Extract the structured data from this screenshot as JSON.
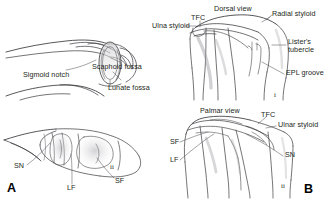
{
  "figure": {
    "background_color": "#ffffff",
    "ink_color": "#231f20",
    "width": 331,
    "height": 206
  },
  "panels": [
    {
      "letter": "A",
      "description": "distal radius articular surface, lateral and end-on views"
    },
    {
      "letter": "B",
      "description": "distal radius dorsal and palmar views"
    }
  ],
  "panel_a": {
    "letter": "A",
    "labels": [
      {
        "text": "Sigmoid notch",
        "x": 23,
        "y": 71
      },
      {
        "text": "Scaphoid fossa",
        "x": 92,
        "y": 63
      },
      {
        "text": "Lunate fossa",
        "x": 108,
        "y": 84
      }
    ],
    "abbreviations": [
      {
        "text": "SN",
        "x": 14,
        "y": 166
      },
      {
        "text": "LF",
        "x": 67,
        "y": 187
      },
      {
        "text": "SF",
        "x": 115,
        "y": 180
      }
    ],
    "markers": [
      {
        "text": "ii",
        "x": 110,
        "y": 167
      }
    ]
  },
  "panel_b": {
    "letter": "B",
    "dorsal_view_title": "Dorsal view",
    "palmar_view_title": "Palmar view",
    "labels": [
      {
        "text": "Dorsal view",
        "x": 214,
        "y": 7
      },
      {
        "text": "TFC",
        "x": 191,
        "y": 16
      },
      {
        "text": "Ulna styloid",
        "x": 152,
        "y": 24
      },
      {
        "text": "Radial styloid",
        "x": 272,
        "y": 12
      },
      {
        "text": "Lister's",
        "x": 288,
        "y": 40
      },
      {
        "text": "tubercle",
        "x": 288,
        "y": 48
      },
      {
        "text": "EPL groove",
        "x": 286,
        "y": 71
      },
      {
        "text": "Palmar view",
        "x": 200,
        "y": 109
      },
      {
        "text": "TFC",
        "x": 261,
        "y": 113
      },
      {
        "text": "Ulnar styloid",
        "x": 278,
        "y": 123
      }
    ],
    "abbreviations": [
      {
        "text": "SF",
        "x": 170,
        "y": 140
      },
      {
        "text": "LF",
        "x": 170,
        "y": 158
      },
      {
        "text": "SN",
        "x": 285,
        "y": 153
      }
    ],
    "markers": [
      {
        "text": "i",
        "x": 274,
        "y": 94
      },
      {
        "text": "ii",
        "x": 281,
        "y": 185
      }
    ]
  },
  "panel_letters": [
    {
      "text": "A",
      "x": 7,
      "y": 184
    },
    {
      "text": "B",
      "x": 304,
      "y": 185
    }
  ]
}
